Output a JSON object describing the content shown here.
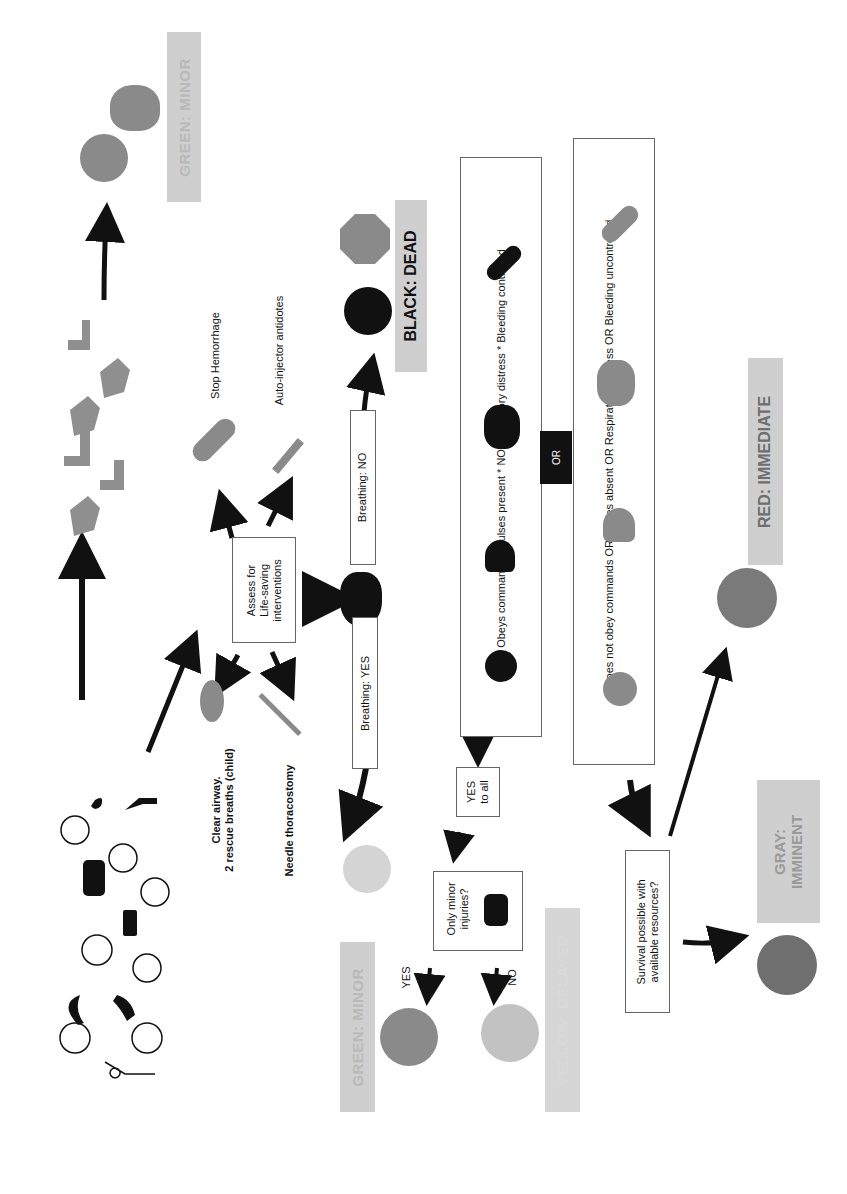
{
  "diagram": {
    "orientation": "rotated-90-ccw",
    "start": {
      "crowd_icons": [
        "fire-icon",
        "smiley-icon",
        "fallen-person-icon",
        "car-crash-icon",
        "smiley-icon",
        "smiley-icon",
        "gun-icon",
        "smiley-icon",
        "smiley-icon",
        "wave-icon",
        "tornado-icon",
        "smiley-icon",
        "smiley-icon",
        "fallen-person-icon"
      ]
    },
    "walking_path": {
      "icons": [
        "hand-icon",
        "foot-icon",
        "hand-icon",
        "foot-icon",
        "hand-icon",
        "foot-icon"
      ],
      "result_label": "GREEN: MINOR",
      "result_icons": [
        "happy-face-icon",
        "tree-icon"
      ]
    },
    "assess_box": {
      "line1": "Assess for",
      "line2": "Life-saving",
      "line3": "interventions"
    },
    "interventions": {
      "stop_hemorrhage": "Stop Hemorrhage",
      "auto_injector": "Auto-injector antidotes",
      "clear_airway_line1": "Clear airway.",
      "clear_airway_line2": "2 rescue breaths (child)",
      "needle": "Needle thoracostomy"
    },
    "breathing": {
      "no_label": "Breathing: NO",
      "yes_label": "Breathing: YES"
    },
    "dead": {
      "label": "BLACK: DEAD"
    },
    "criteria": {
      "positive": "Obeys commands * Pulses present * NO respiratory distress * Bleeding controlled",
      "or_label": "OR",
      "negative": "Does not obey commands OR Pulses absent OR Respiratory distress OR Bleeding uncontrolled"
    },
    "yes_to_all": {
      "line1": "YES",
      "line2": "to all"
    },
    "minor_question": {
      "line1": "Only minor",
      "line2": "injuries?",
      "yes": "YES",
      "no": "NO"
    },
    "green_minor_2": "GREEN: MINOR",
    "yellow": "YELLOW: DELAYED",
    "survival": {
      "line1": "Survival possible with",
      "line2": "available resources?"
    },
    "gray": {
      "line1": "GRAY:",
      "line2": "IMMINENT"
    },
    "red": "RED: IMMEDIATE",
    "colors": {
      "green_face": "#8a8a8a",
      "yellow_face": "#bdbdbd",
      "red_face": "#7a7a7a",
      "gray_face": "#6f6f6f",
      "black_face": "#111111",
      "label_bg": "#cfcfcf",
      "arrow": "#111111"
    }
  }
}
